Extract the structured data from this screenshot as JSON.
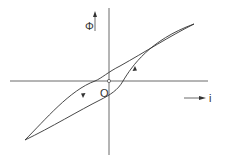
{
  "diagram": {
    "type": "hysteresis-loop",
    "labels": {
      "y_axis": "Φ",
      "x_axis": "i",
      "origin": "O"
    },
    "colors": {
      "line": "#333333",
      "background": "#ffffff"
    }
  }
}
